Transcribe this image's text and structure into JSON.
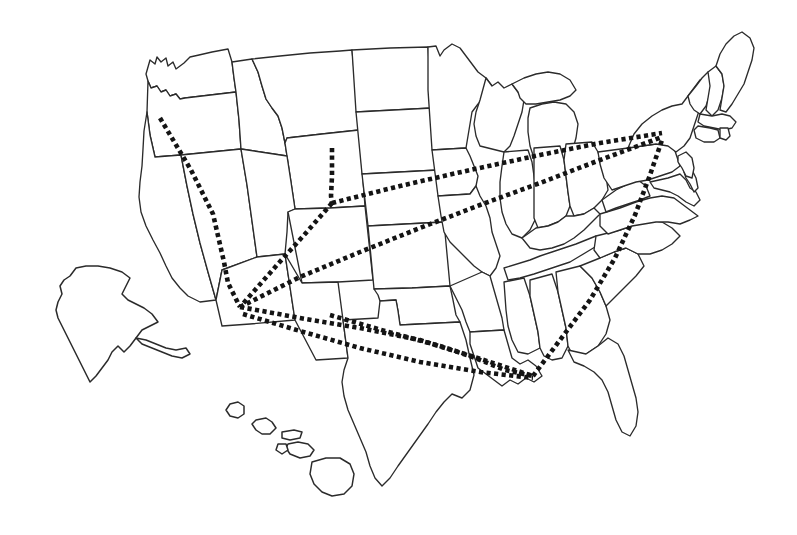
{
  "figure": {
    "kind": "map",
    "width": 797,
    "height": 535,
    "background_color": "#ffffff",
    "outline_color": "#2b2b2b",
    "route_color": "#141414",
    "projection_note": "Contiguous United States with Alaska and Hawaii insets",
    "labels_present": "none",
    "legend_present": "none"
  },
  "map_data": {
    "type": "route-map",
    "region": "United States",
    "insets": [
      "Alaska",
      "Hawaii"
    ],
    "route_style": {
      "stroke": "#141414",
      "style": "dotted",
      "dot_size_px": 4.6,
      "dot_gap_px": 3.4
    },
    "hubs": [
      {
        "name": "pacific-northwest-endpoint",
        "x": 160,
        "y": 118
      },
      {
        "name": "southwest-hub",
        "x": 240,
        "y": 307
      },
      {
        "name": "northern-rockies-endpoint",
        "x": 332,
        "y": 148
      },
      {
        "name": "central-plains-junction",
        "x": 332,
        "y": 203
      },
      {
        "name": "gulf-coast-endpoint",
        "x": 533,
        "y": 376
      },
      {
        "name": "northeast-endpoint",
        "x": 662,
        "y": 133
      },
      {
        "name": "south-central-endpoint",
        "x": 330,
        "y": 315
      }
    ],
    "routes": [
      {
        "id": "route-northwest-southwest",
        "from": "pacific-northwest-endpoint",
        "to": "southwest-hub",
        "points": [
          [
            160,
            118
          ],
          [
            191,
            170
          ],
          [
            213,
            214
          ],
          [
            224,
            262
          ],
          [
            228,
            283
          ],
          [
            240,
            307
          ]
        ]
      },
      {
        "id": "route-rockies-plains",
        "from": "northern-rockies-endpoint",
        "to": "central-plains-junction",
        "points": [
          [
            332,
            148
          ],
          [
            332,
            176
          ],
          [
            331,
            196
          ],
          [
            332,
            203
          ]
        ]
      },
      {
        "id": "route-plains-southwest",
        "from": "central-plains-junction",
        "to": "southwest-hub",
        "points": [
          [
            332,
            203
          ],
          [
            305,
            234
          ],
          [
            277,
            265
          ],
          [
            255,
            290
          ],
          [
            240,
            307
          ]
        ]
      },
      {
        "id": "route-plains-northeast",
        "from": "central-plains-junction",
        "to": "northeast-endpoint",
        "points": [
          [
            332,
            203
          ],
          [
            400,
            186
          ],
          [
            470,
            170
          ],
          [
            540,
            155
          ],
          [
            600,
            143
          ],
          [
            662,
            133
          ]
        ]
      },
      {
        "id": "route-southwest-northeast",
        "from": "southwest-hub",
        "to": "northeast-endpoint",
        "points": [
          [
            240,
            307
          ],
          [
            300,
            277
          ],
          [
            360,
            252
          ],
          [
            420,
            228
          ],
          [
            480,
            205
          ],
          [
            540,
            183
          ],
          [
            600,
            160
          ],
          [
            662,
            137
          ]
        ]
      },
      {
        "id": "route-southwest-gulf-north",
        "from": "southwest-hub",
        "to": "gulf-coast-endpoint",
        "points": [
          [
            240,
            307
          ],
          [
            300,
            318
          ],
          [
            360,
            328
          ],
          [
            420,
            340
          ],
          [
            470,
            356
          ],
          [
            505,
            370
          ],
          [
            533,
            376
          ]
        ]
      },
      {
        "id": "route-southcentral-gulf",
        "from": "south-central-endpoint",
        "to": "gulf-coast-endpoint",
        "points": [
          [
            330,
            315
          ],
          [
            385,
            331
          ],
          [
            440,
            346
          ],
          [
            490,
            362
          ],
          [
            533,
            376
          ]
        ]
      },
      {
        "id": "route-southwest-gulf-south",
        "from": "southwest-hub",
        "to": "gulf-coast-endpoint",
        "points": [
          [
            243,
            314
          ],
          [
            300,
            331
          ],
          [
            360,
            348
          ],
          [
            420,
            362
          ],
          [
            480,
            372
          ],
          [
            533,
            378
          ]
        ]
      },
      {
        "id": "route-gulf-northeast",
        "from": "gulf-coast-endpoint",
        "to": "northeast-endpoint",
        "points": [
          [
            533,
            376
          ],
          [
            560,
            340
          ],
          [
            590,
            300
          ],
          [
            615,
            258
          ],
          [
            635,
            215
          ],
          [
            650,
            175
          ],
          [
            662,
            140
          ]
        ]
      }
    ]
  }
}
